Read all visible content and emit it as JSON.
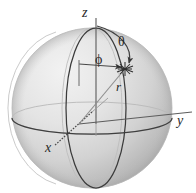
{
  "figure": {
    "type": "3d-geometry-diagram",
    "width": 196,
    "height": 193,
    "background_color": "#ffffff"
  },
  "labels": {
    "z_axis": "z",
    "y_axis": "y",
    "x_axis": "x",
    "polar_angle": "θ",
    "azimuth_angle": "ϕ",
    "radius": "r"
  },
  "colors": {
    "sphere_light": "#ececec",
    "sphere_mid": "#d8d8d8",
    "sphere_dark": "#b4b4b4",
    "outline": "#3a3a3a",
    "axis": "#555555",
    "faint_line": "#9a9a9a",
    "text": "#2a2a2a"
  },
  "geometry": {
    "sphere_center": {
      "x": 92,
      "y": 108
    },
    "sphere_radius": 80,
    "origin": {
      "x": 79,
      "y": 124
    },
    "point": {
      "x": 125,
      "y": 69
    },
    "z_axis_top": {
      "x": 96,
      "y": 18
    },
    "y_axis_end": {
      "x": 176,
      "y": 121
    },
    "x_axis_end": {
      "x": 54,
      "y": 146
    }
  },
  "elements": [
    {
      "name": "sphere-body",
      "desc": "shaded sphere"
    },
    {
      "name": "equator-ellipse",
      "desc": "horizontal great circle"
    },
    {
      "name": "meridian-ellipse",
      "desc": "vertical great circle through poles"
    },
    {
      "name": "z-axis-line",
      "desc": "vertical axis through north pole"
    },
    {
      "name": "y-axis-line",
      "desc": "axis to the right"
    },
    {
      "name": "x-axis-line",
      "desc": "axis to lower left"
    },
    {
      "name": "radius-line",
      "desc": "line from origin to surface point"
    },
    {
      "name": "theta-arc",
      "desc": "arc from z-axis to point with arrowhead"
    },
    {
      "name": "phi-arc",
      "desc": "horizontal arc to point with arrowhead"
    },
    {
      "name": "point-marker",
      "desc": "starburst marker at surface point"
    }
  ]
}
